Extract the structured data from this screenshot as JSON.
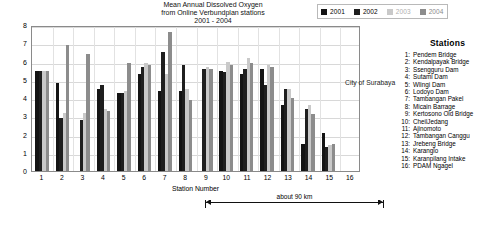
{
  "title": {
    "line1": "Mean Annual Dissolved Oxygen",
    "line2": "from Online Verbundplan stations",
    "line3": "2001 - 2004"
  },
  "legend": {
    "position": "top-right",
    "items": [
      {
        "label": "2001",
        "color": "#141414"
      },
      {
        "label": "2002",
        "color": "#1f1f1f"
      },
      {
        "label": "2003",
        "color": "#c9c9c9"
      },
      {
        "label": "2004",
        "color": "#8c8c8c"
      }
    ]
  },
  "annotations": {
    "city": "City of Surabaya",
    "span": "about 90 km"
  },
  "stations": {
    "heading": "Stations",
    "items": [
      {
        "num": "1:",
        "name": "Pendem Bridge"
      },
      {
        "num": "2:",
        "name": "Kendalpayak Bridge"
      },
      {
        "num": "3:",
        "name": "Ssengguru Dam"
      },
      {
        "num": "4:",
        "name": "Sutami Dam"
      },
      {
        "num": "5:",
        "name": "Wlingi Dam"
      },
      {
        "num": "6:",
        "name": "Lodoyo Dam"
      },
      {
        "num": "7:",
        "name": "Tambangan Pakel"
      },
      {
        "num": "8:",
        "name": "Micain Barrage"
      },
      {
        "num": "9:",
        "name": "Kertosono Old Bridge"
      },
      {
        "num": "10:",
        "name": "CheilJedang"
      },
      {
        "num": "11:",
        "name": "Ajinomoto"
      },
      {
        "num": "12:",
        "name": "Tambangan Canggu"
      },
      {
        "num": "13:",
        "name": "Jrebeng Bridge"
      },
      {
        "num": "14:",
        "name": "Karanglo"
      },
      {
        "num": "15:",
        "name": "Karanpilang Intake"
      },
      {
        "num": "16:",
        "name": "PDAM Ngagel"
      }
    ]
  },
  "caption": {
    "text": ""
  },
  "chart_data": {
    "type": "bar",
    "title": "Mean Annual Dissolved Oxygen from Online Verbundplan stations 2001 - 2004",
    "xlabel": "Station Number",
    "ylabel": "Oxygen concentrations [mg/l]",
    "ylim": [
      0,
      8
    ],
    "yticks": [
      "0",
      "1",
      "2",
      "3",
      "4",
      "5",
      "6",
      "7",
      "8"
    ],
    "grid": true,
    "categories": [
      "1",
      "2",
      "3",
      "4",
      "5",
      "6",
      "7",
      "8",
      "9",
      "10",
      "11",
      "12",
      "13",
      "14",
      "15",
      "16"
    ],
    "series": [
      {
        "name": "2001",
        "color": "#141414",
        "values": [
          5.5,
          4.8,
          null,
          4.5,
          4.3,
          5.3,
          4.4,
          4.4,
          null,
          5.5,
          5.3,
          5.6,
          3.6,
          1.5,
          2.1,
          null
        ]
      },
      {
        "name": "2002",
        "color": "#1f1f1f",
        "values": [
          5.5,
          2.9,
          2.8,
          4.7,
          4.3,
          5.7,
          6.5,
          5.8,
          5.6,
          5.4,
          5.6,
          4.7,
          4.5,
          3.4,
          1.3,
          null
        ]
      },
      {
        "name": "2003",
        "color": "#c9c9c9",
        "values": [
          5.5,
          3.2,
          3.2,
          3.4,
          4.4,
          5.9,
          5.3,
          4.5,
          5.7,
          6.0,
          6.2,
          5.8,
          4.5,
          3.6,
          1.4,
          null
        ]
      },
      {
        "name": "2004",
        "color": "#8c8c8c",
        "values": [
          5.5,
          6.9,
          6.4,
          3.3,
          5.9,
          5.8,
          7.6,
          3.9,
          5.6,
          5.8,
          5.9,
          5.7,
          4.0,
          3.1,
          1.5,
          null
        ]
      }
    ]
  }
}
